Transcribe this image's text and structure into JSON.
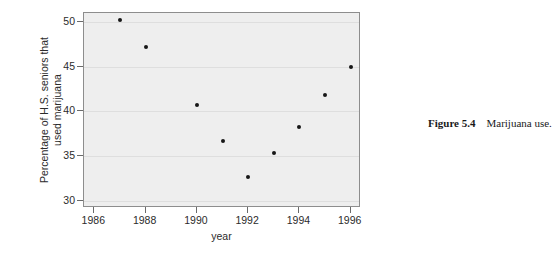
{
  "caption": {
    "label": "Figure 5.4",
    "text": "Marijuana use."
  },
  "chart_data": {
    "type": "scatter",
    "title": "",
    "xlabel": "year",
    "ylabel": "Percentage of H.S. seniors that used marijuana",
    "ylabel_lines": [
      "Percentage of H.S. seniors that",
      "used marijuana"
    ],
    "xlim": [
      1985.6,
      1996.4
    ],
    "ylim": [
      29.2,
      51.0
    ],
    "xticks": [
      1986,
      1988,
      1990,
      1992,
      1994,
      1996
    ],
    "xtick_labels": [
      "1986",
      "1988",
      "1990",
      "1992",
      "1994",
      "1996"
    ],
    "yticks": [
      30,
      35,
      40,
      45,
      50
    ],
    "ytick_labels": [
      "30",
      "35",
      "40",
      "45",
      "50"
    ],
    "grid": "horizontal",
    "legend": "none",
    "plot_background": "#eeeeee",
    "point_color": "#161616",
    "x": [
      1987,
      1988,
      1990,
      1991,
      1992,
      1993,
      1994,
      1995,
      1996
    ],
    "values": [
      50.2,
      47.2,
      40.7,
      36.7,
      32.7,
      35.3,
      38.3,
      41.8,
      45.0
    ]
  }
}
